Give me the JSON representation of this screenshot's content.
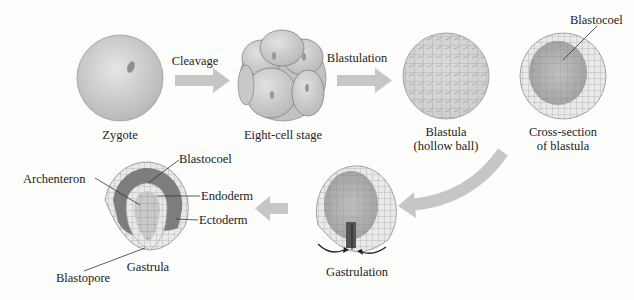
{
  "colors": {
    "background": "#fdfdfb",
    "arrow": "#c9c9c9",
    "cell_fill": "#d6d6d6",
    "cell_dark": "#8a8a8a",
    "text": "#222222"
  },
  "stages": [
    {
      "id": "zygote",
      "label": "Zygote"
    },
    {
      "id": "eight-cell",
      "label": "Eight-cell stage"
    },
    {
      "id": "blastula",
      "label_line1": "Blastula",
      "label_line2": "(hollow ball)"
    },
    {
      "id": "cross-section",
      "label_line1": "Cross-section",
      "label_line2": "of blastula",
      "callout": "Blastocoel"
    },
    {
      "id": "gastrulation",
      "label": "Gastrulation"
    },
    {
      "id": "gastrula",
      "label": "Gastrula",
      "callouts": {
        "archenteron": "Archenteron",
        "blastocoel": "Blastocoel",
        "endoderm": "Endoderm",
        "ectoderm": "Ectoderm",
        "blastopore": "Blastopore"
      }
    }
  ],
  "processes": {
    "cleavage": "Cleavage",
    "blastulation": "Blastulation"
  }
}
